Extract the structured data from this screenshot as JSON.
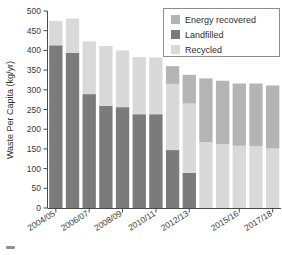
{
  "chart_data": {
    "type": "bar",
    "subtype": "stacked-vertical",
    "title": "",
    "xlabel": "",
    "ylabel": "Waste Per Capita (kg/yr)",
    "ylim": [
      0,
      500
    ],
    "yticks": [
      0,
      50,
      100,
      150,
      200,
      250,
      300,
      350,
      400,
      450,
      500
    ],
    "ytick_labels": [
      "0",
      "50",
      "100",
      "150",
      "200",
      "250",
      "300",
      "350",
      "400",
      "450",
      "500"
    ],
    "grid": false,
    "legend_position": "top-right",
    "categories": [
      "2004/05",
      "2005/06",
      "2006/07",
      "2007/08",
      "2008/09",
      "2009/10",
      "2010/11",
      "2011/12",
      "2012/13",
      "2013/14",
      "2014/15",
      "2015/16",
      "2016/17",
      "2017/18"
    ],
    "category_tick_labels": [
      "2004/05",
      "2006/07",
      "2008/09",
      "2010/11",
      "2012/13",
      "2015/16",
      "2017/18"
    ],
    "category_tick_indices": [
      0,
      2,
      4,
      6,
      8,
      11,
      13
    ],
    "series": [
      {
        "name": "Landfilled",
        "color": "#7b7b7b",
        "values": [
          413,
          394,
          289,
          259,
          256,
          238,
          238,
          147,
          89,
          0,
          0,
          0,
          0,
          0
        ]
      },
      {
        "name": "Recycled",
        "color": "#d9d9d9",
        "values": [
          62,
          87,
          134,
          152,
          144,
          145,
          144,
          168,
          176,
          167,
          162,
          158,
          157,
          151
        ]
      },
      {
        "name": "Energy recovered",
        "color": "#b4b4b4",
        "values": [
          0,
          0,
          0,
          0,
          0,
          0,
          0,
          45,
          73,
          162,
          161,
          158,
          159,
          160
        ]
      }
    ],
    "stack_order": [
      "Landfilled",
      "Recycled",
      "Energy recovered"
    ],
    "totals": [
      475,
      481,
      423,
      411,
      400,
      383,
      382,
      360,
      338,
      329,
      323,
      316,
      316,
      311
    ]
  },
  "legend": {
    "items": [
      {
        "label": "Energy recovered",
        "color": "#b4b4b4"
      },
      {
        "label": "Landfilled",
        "color": "#7b7b7b"
      },
      {
        "label": "Recycled",
        "color": "#d9d9d9"
      }
    ]
  },
  "axes": {
    "y_title": "Waste Per Capita (kg/yr)"
  },
  "colors": {
    "energy_recovered": "#b4b4b4",
    "landfilled": "#7b7b7b",
    "recycled": "#d9d9d9",
    "axis": "#4a4a4a",
    "text": "#2e2e2e",
    "background": "#ffffff"
  }
}
